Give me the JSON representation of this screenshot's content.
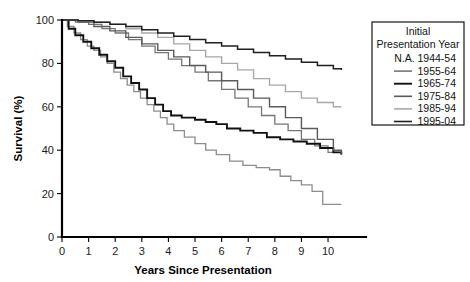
{
  "chart_data": {
    "type": "line",
    "title": "",
    "xlabel": "Years Since Presentation",
    "ylabel": "Survival (%)",
    "xlim": [
      0,
      10.6
    ],
    "ylim": [
      0,
      100
    ],
    "xticks": [
      "0",
      "1",
      "2",
      "3",
      "4",
      "5",
      "6",
      "7",
      "8",
      "9",
      "10"
    ],
    "yticks": [
      "0",
      "20",
      "40",
      "60",
      "80",
      "100"
    ],
    "grid": false,
    "legend_position": "top-right",
    "legend_title_line1": "Initial",
    "legend_title_line2": "Presentation Year",
    "series": [
      {
        "name": "N.A. 1944-54",
        "label": "N.A. 1944-54",
        "color": "#8c8c8c",
        "width": 1.3,
        "has_swatch": false,
        "x": [
          0,
          0.2,
          0.45,
          0.7,
          0.95,
          1.2,
          1.45,
          1.7,
          1.95,
          2.2,
          2.45,
          2.7,
          2.95,
          3.2,
          3.45,
          3.7,
          3.95,
          4.2,
          4.6,
          5.0,
          5.4,
          5.8,
          6.3,
          6.8,
          7.3,
          7.8,
          8.2,
          8.6,
          9.0,
          9.4,
          9.8,
          10.5
        ],
        "y": [
          100,
          97,
          94,
          91,
          88,
          86,
          83,
          80,
          76,
          73,
          70,
          67,
          64,
          61,
          58,
          55,
          52,
          49,
          46,
          43,
          40,
          38,
          35,
          33,
          32,
          31,
          28,
          26,
          24,
          21,
          15,
          15
        ]
      },
      {
        "name": "1955-64",
        "label": "1955-64",
        "color": "#767676",
        "width": 1.3,
        "has_swatch": true,
        "x": [
          0,
          0.5,
          1.0,
          1.5,
          2.0,
          2.5,
          3.0,
          3.5,
          4.0,
          4.5,
          5.0,
          5.5,
          6.0,
          6.5,
          7.0,
          7.5,
          8.0,
          8.5,
          9.0,
          9.5,
          10.0,
          10.5
        ],
        "y": [
          100,
          99,
          98,
          96,
          94,
          91,
          88,
          85,
          82,
          79,
          76,
          72,
          68,
          64,
          60,
          56,
          52,
          49,
          45,
          42,
          39,
          38
        ]
      },
      {
        "name": "1965-74",
        "label": "1965-74",
        "color": "#111111",
        "width": 1.9,
        "has_swatch": true,
        "x": [
          0,
          0.25,
          0.5,
          0.8,
          1.1,
          1.4,
          1.7,
          2.0,
          2.3,
          2.6,
          2.9,
          3.2,
          3.5,
          3.8,
          4.1,
          4.5,
          5.0,
          5.4,
          5.8,
          6.2,
          6.7,
          7.2,
          7.7,
          8.2,
          8.7,
          9.2,
          9.7,
          10.2,
          10.5
        ],
        "y": [
          100,
          96,
          93,
          90,
          87,
          84,
          81,
          78,
          74,
          71,
          68,
          64,
          61,
          58,
          56,
          55,
          54,
          53,
          52,
          50,
          49,
          48,
          46,
          45,
          44,
          43,
          41,
          39,
          38
        ]
      },
      {
        "name": "1975-84",
        "label": "1975-84",
        "color": "#5a5a5a",
        "width": 1.4,
        "has_swatch": true,
        "x": [
          0,
          0.6,
          1.2,
          1.8,
          2.4,
          3.0,
          3.6,
          4.2,
          4.8,
          5.4,
          6.0,
          6.6,
          7.2,
          7.8,
          8.4,
          9.0,
          9.6,
          10.2,
          10.5
        ],
        "y": [
          100,
          99,
          97,
          95,
          92,
          89,
          86,
          83,
          79,
          76,
          72,
          68,
          64,
          60,
          55,
          50,
          45,
          40,
          38
        ]
      },
      {
        "name": "1985-94",
        "label": "1985-94",
        "color": "#a8a8a8",
        "width": 1.4,
        "has_swatch": true,
        "x": [
          0,
          0.6,
          1.2,
          1.8,
          2.4,
          3.0,
          3.6,
          4.2,
          4.8,
          5.4,
          6.0,
          6.6,
          7.2,
          7.8,
          8.4,
          9.0,
          9.6,
          10.2,
          10.5
        ],
        "y": [
          100,
          99.5,
          99,
          98,
          96,
          94,
          92,
          89,
          86,
          83,
          80,
          77,
          73,
          70,
          67,
          64,
          62,
          60,
          60
        ]
      },
      {
        "name": "1995-04",
        "label": "1995-04",
        "color": "#1f1f1f",
        "width": 1.5,
        "has_swatch": true,
        "x": [
          0,
          0.6,
          1.2,
          1.8,
          2.4,
          3.0,
          3.6,
          4.2,
          4.8,
          5.4,
          6.0,
          6.6,
          7.2,
          7.8,
          8.4,
          9.0,
          9.6,
          10.2,
          10.5
        ],
        "y": [
          100,
          99.6,
          99,
          98,
          97,
          95.5,
          94,
          92.5,
          91,
          89.5,
          88,
          86.5,
          85,
          83.5,
          82,
          80.5,
          79,
          77.5,
          77
        ]
      }
    ]
  }
}
